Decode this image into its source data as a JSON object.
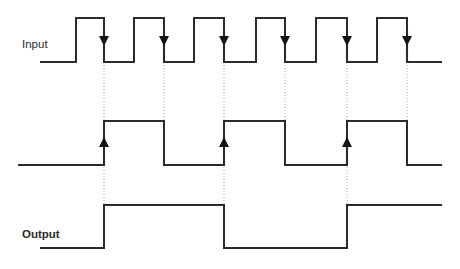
{
  "diagram": {
    "title": "",
    "type": "digital-timing-diagram",
    "canvas": {
      "width": 460,
      "height": 269
    },
    "colors": {
      "trace": "#2b2b2b",
      "guide": "#a9a9a9",
      "marker": "#141414",
      "background": "#ffffff"
    },
    "labels": {
      "input": "Input",
      "output": "Output"
    },
    "label_positions": {
      "input": {
        "x": 22,
        "y": 48
      },
      "output": {
        "x": 22,
        "y": 238
      }
    }
  },
  "chart_data": {
    "type": "line",
    "title": "",
    "xlabel": "",
    "ylabel": "",
    "signals": [
      {
        "name": "Input",
        "label": "Input",
        "row": 1,
        "low_y": 62,
        "high_y": 18,
        "x_start": 40,
        "x_end": 442,
        "initial_level": "low",
        "transitions": [
          {
            "x": 76,
            "edge": "rise"
          },
          {
            "x": 104,
            "edge": "fall"
          },
          {
            "x": 134,
            "edge": "rise"
          },
          {
            "x": 164,
            "edge": "fall"
          },
          {
            "x": 194,
            "edge": "rise"
          },
          {
            "x": 224,
            "edge": "fall"
          },
          {
            "x": 256,
            "edge": "rise"
          },
          {
            "x": 285,
            "edge": "fall"
          },
          {
            "x": 316,
            "edge": "rise"
          },
          {
            "x": 347,
            "edge": "fall"
          },
          {
            "x": 377,
            "edge": "rise"
          },
          {
            "x": 407,
            "edge": "fall"
          }
        ],
        "markers": [
          {
            "x": 104,
            "direction": "down"
          },
          {
            "x": 164,
            "direction": "down"
          },
          {
            "x": 224,
            "direction": "down"
          },
          {
            "x": 285,
            "direction": "down"
          },
          {
            "x": 347,
            "direction": "down"
          },
          {
            "x": 407,
            "direction": "down"
          }
        ]
      },
      {
        "name": "Middle",
        "label": "",
        "row": 2,
        "low_y": 165,
        "high_y": 121,
        "x_start": 18,
        "x_end": 442,
        "initial_level": "low",
        "transitions": [
          {
            "x": 104,
            "edge": "rise"
          },
          {
            "x": 164,
            "edge": "fall"
          },
          {
            "x": 224,
            "edge": "rise"
          },
          {
            "x": 285,
            "edge": "fall"
          },
          {
            "x": 347,
            "edge": "rise"
          },
          {
            "x": 407,
            "edge": "fall"
          }
        ],
        "markers": [
          {
            "x": 104,
            "direction": "up"
          },
          {
            "x": 224,
            "direction": "up"
          },
          {
            "x": 347,
            "direction": "up"
          }
        ]
      },
      {
        "name": "Output",
        "label": "Output",
        "row": 3,
        "low_y": 248,
        "high_y": 205,
        "x_start": 40,
        "x_end": 442,
        "initial_level": "low",
        "transitions": [
          {
            "x": 104,
            "edge": "rise"
          },
          {
            "x": 224,
            "edge": "fall"
          },
          {
            "x": 347,
            "edge": "rise"
          }
        ],
        "markers": []
      }
    ],
    "guides": [
      {
        "x": 104,
        "y1": 62,
        "y2": 205
      },
      {
        "x": 164,
        "y1": 62,
        "y2": 165
      },
      {
        "x": 224,
        "y1": 62,
        "y2": 205
      },
      {
        "x": 285,
        "y1": 62,
        "y2": 165
      },
      {
        "x": 347,
        "y1": 62,
        "y2": 205
      },
      {
        "x": 407,
        "y1": 62,
        "y2": 165
      }
    ]
  }
}
